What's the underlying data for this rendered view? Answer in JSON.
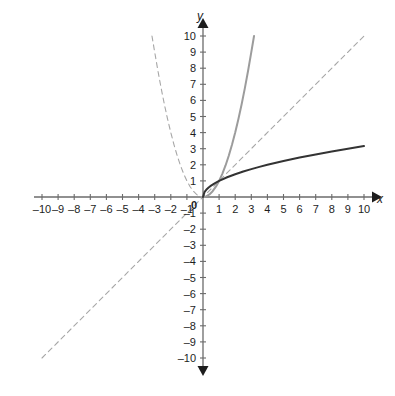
{
  "chart_data": {
    "type": "line",
    "title": "",
    "subtitle": "",
    "xlabel": "x",
    "ylabel": "y",
    "xlim": [
      -10,
      10
    ],
    "ylim": [
      -10,
      10
    ],
    "grid": false,
    "legend": "none",
    "axis_style": "cartesian-arrows",
    "x_ticks": [
      "-10",
      "-9",
      "-8",
      "-7",
      "-6",
      "-5",
      "-4",
      "-3",
      "-2",
      "-1",
      "1",
      "2",
      "3",
      "4",
      "5",
      "6",
      "7",
      "8",
      "9",
      "10"
    ],
    "y_ticks": [
      "10",
      "9",
      "8",
      "7",
      "6",
      "5",
      "4",
      "3",
      "2",
      "1",
      "-1",
      "-2",
      "-3",
      "-4",
      "-5",
      "-6",
      "-7",
      "-8",
      "-9",
      "-10"
    ],
    "origin_label": "0",
    "x_tick_values": [
      -10,
      -9,
      -8,
      -7,
      -6,
      -5,
      -4,
      -3,
      -2,
      -1,
      1,
      2,
      3,
      4,
      5,
      6,
      7,
      8,
      9,
      10
    ],
    "y_tick_values": [
      10,
      9,
      8,
      7,
      6,
      5,
      4,
      3,
      2,
      1,
      -1,
      -2,
      -3,
      -4,
      -5,
      -6,
      -7,
      -8,
      -9,
      -10
    ],
    "series": [
      {
        "name": "y = x^2 (left branch)",
        "equation": "y = x²",
        "style": "dashed",
        "color": "#a7a7a7",
        "width": 1.1,
        "x": [
          -3.17,
          -3.0,
          -2.8,
          -2.6,
          -2.4,
          -2.2,
          -2.0,
          -1.8,
          -1.6,
          -1.4,
          -1.2,
          -1.0,
          -0.8,
          -0.6,
          -0.4,
          -0.2,
          0
        ],
        "values": [
          10.0,
          9.0,
          7.84,
          6.76,
          5.76,
          4.84,
          4.0,
          3.24,
          2.56,
          1.96,
          1.44,
          1.0,
          0.64,
          0.36,
          0.16,
          0.04,
          0
        ]
      },
      {
        "name": "y = x^2 (right branch)",
        "equation": "y = x²",
        "style": "solid",
        "color": "#9c9c9c",
        "width": 2.0,
        "x": [
          0,
          0.2,
          0.4,
          0.6,
          0.8,
          1.0,
          1.2,
          1.4,
          1.6,
          1.8,
          2.0,
          2.2,
          2.4,
          2.6,
          2.8,
          3.0,
          3.17
        ],
        "values": [
          0,
          0.04,
          0.16,
          0.36,
          0.64,
          1.0,
          1.44,
          1.96,
          2.56,
          3.24,
          4.0,
          4.84,
          5.76,
          6.76,
          7.84,
          9.0,
          10.0
        ]
      },
      {
        "name": "y = x",
        "equation": "y = x",
        "style": "dashed",
        "color": "#a7a7a7",
        "width": 1.1,
        "x": [
          -10,
          10
        ],
        "values": [
          -10,
          10
        ]
      },
      {
        "name": "y = sqrt(x)",
        "equation": "y = √x",
        "style": "solid",
        "color": "#333333",
        "width": 2.0,
        "x": [
          0,
          0.1,
          0.2,
          0.35,
          0.5,
          0.75,
          1.0,
          1.5,
          2.0,
          2.5,
          3.0,
          3.5,
          4.0,
          5.0,
          6.0,
          7.0,
          8.0,
          9.0,
          10.0
        ],
        "values": [
          0,
          0.316,
          0.447,
          0.592,
          0.707,
          0.866,
          1.0,
          1.225,
          1.414,
          1.581,
          1.732,
          1.871,
          2.0,
          2.236,
          2.449,
          2.646,
          2.828,
          3.0,
          3.162
        ]
      }
    ],
    "annotations": [
      {
        "text": "all curves pass through (1, 1)",
        "x": 1,
        "y": 1
      }
    ]
  },
  "figure": {
    "background_color": "#ffffff",
    "axis_color": "#6b6b6b",
    "text_color": "#1d1d1d"
  }
}
